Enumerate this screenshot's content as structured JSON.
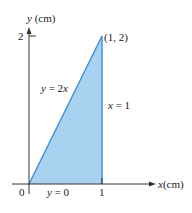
{
  "figure": {
    "x_axis_label_var": "x",
    "x_axis_label_unit": "(cm)",
    "y_axis_label_var": "y",
    "y_axis_label_unit": "(cm)",
    "origin_label": "0",
    "x_tick_label": "1",
    "y_tick_label": "2",
    "vertex_label": "(1, 2)",
    "line_labels": {
      "hypotenuse": "y = 2x",
      "vertical": "x = 1",
      "base": "y = 0"
    },
    "colors": {
      "fill": "#a9d1f0",
      "stroke": "#3d8fd6",
      "axis": "#333333"
    }
  }
}
